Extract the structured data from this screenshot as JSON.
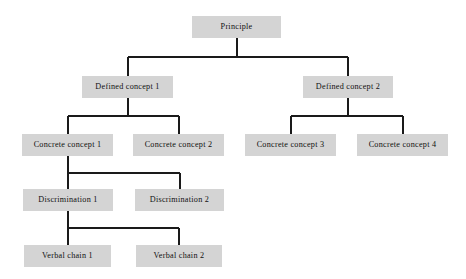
{
  "diagram": {
    "type": "hierarchy-tree",
    "title": "",
    "orientation": "top-down",
    "box_fill": "#d4d4d4",
    "line_color": "#1a1a1a",
    "background": "#ffffff",
    "levels": [
      "Principle",
      "Defined concept",
      "Concrete concept",
      "Discrimination",
      "Verbal chain"
    ],
    "nodes": [
      {
        "id": "principle",
        "label": "Principle",
        "level": 0,
        "x": 192,
        "y": 16,
        "w": 89,
        "h": 22
      },
      {
        "id": "defined1",
        "label": "Defined concept 1",
        "level": 1,
        "x": 82,
        "y": 76,
        "w": 91,
        "h": 22
      },
      {
        "id": "defined2",
        "label": "Defined concept 2",
        "level": 1,
        "x": 303,
        "y": 76,
        "w": 90,
        "h": 22
      },
      {
        "id": "concrete1",
        "label": "Concrete concept 1",
        "level": 2,
        "x": 22,
        "y": 134,
        "w": 91,
        "h": 22
      },
      {
        "id": "concrete2",
        "label": "Concrete concept 2",
        "level": 2,
        "x": 133,
        "y": 134,
        "w": 91,
        "h": 22
      },
      {
        "id": "concrete3",
        "label": "Concrete concept 3",
        "level": 2,
        "x": 245,
        "y": 134,
        "w": 91,
        "h": 22
      },
      {
        "id": "concrete4",
        "label": "Concrete concept 4",
        "level": 2,
        "x": 357,
        "y": 134,
        "w": 91,
        "h": 22
      },
      {
        "id": "discrim1",
        "label": "Discrimination 1",
        "level": 3,
        "x": 23,
        "y": 189,
        "w": 90,
        "h": 22
      },
      {
        "id": "discrim2",
        "label": "Discrimination 2",
        "level": 3,
        "x": 135,
        "y": 189,
        "w": 89,
        "h": 22
      },
      {
        "id": "verbal1",
        "label": "Verbal chain 1",
        "level": 4,
        "x": 24,
        "y": 245,
        "w": 87,
        "h": 22
      },
      {
        "id": "verbal2",
        "label": "Verbal chain 2",
        "level": 4,
        "x": 136,
        "y": 245,
        "w": 86,
        "h": 22
      }
    ],
    "edges": [
      {
        "from": "principle",
        "to": "defined1",
        "style": "orthogonal"
      },
      {
        "from": "principle",
        "to": "defined2",
        "style": "orthogonal"
      },
      {
        "from": "defined1",
        "to": "concrete1",
        "style": "orthogonal"
      },
      {
        "from": "defined1",
        "to": "concrete2",
        "style": "orthogonal"
      },
      {
        "from": "defined2",
        "to": "concrete3",
        "style": "orthogonal"
      },
      {
        "from": "defined2",
        "to": "concrete4",
        "style": "orthogonal"
      },
      {
        "from": "concrete1",
        "to": "discrim1",
        "style": "orthogonal"
      },
      {
        "from": "concrete1",
        "to": "discrim2",
        "style": "orthogonal"
      },
      {
        "from": "discrim1",
        "to": "verbal1",
        "style": "orthogonal"
      },
      {
        "from": "discrim1",
        "to": "verbal2",
        "style": "orthogonal"
      }
    ]
  }
}
